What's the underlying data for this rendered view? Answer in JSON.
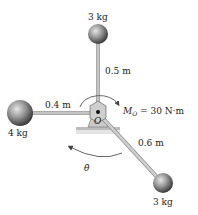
{
  "figure": {
    "type": "rigid-body rotating assembly about fixed pivot",
    "pivot": {
      "label": "O"
    },
    "masses": [
      {
        "id": "top",
        "mass_label": "3 kg",
        "arm_label": "0.5 m",
        "direction": "up"
      },
      {
        "id": "left",
        "mass_label": "4 kg",
        "arm_label": "0.4 m",
        "direction": "left"
      },
      {
        "id": "lower-right",
        "mass_label": "3 kg",
        "arm_label": "0.6 m",
        "direction": "down-right"
      }
    ],
    "moment": {
      "symbol": "M",
      "subscript": "O",
      "value_text": "= 30 N·m",
      "sense": "clockwise"
    },
    "angular_velocity": {
      "symbol": "θ̇",
      "sense": "counterclockwise"
    }
  },
  "colors": {
    "rod": "#b8b8b8",
    "rod_edge": "#6f6f6f",
    "ball_light": "#d8d8d8",
    "ball_dark": "#3a3a3a",
    "support": "#c9c9c9",
    "ink": "#333333"
  }
}
